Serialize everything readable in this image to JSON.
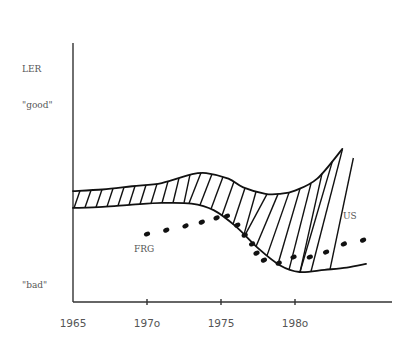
{
  "chart_data": {
    "type": "line",
    "title": "",
    "ylabel": "LER",
    "xlabel": "",
    "y_qualitative_labels": {
      "top": "\"good\"",
      "bottom": "\"bad\""
    },
    "xlim": [
      1965,
      1986.5
    ],
    "ylim": [
      0,
      1
    ],
    "x_ticks": [
      1965,
      1970,
      1975,
      1980
    ],
    "x_tick_labels": [
      "1965",
      "197o",
      "1975",
      "198o"
    ],
    "grid": false,
    "legend": "none",
    "series": [
      {
        "name": "US band upper",
        "style": "solid",
        "points": [
          [
            1965,
            0.433
          ],
          [
            1967,
            0.44
          ],
          [
            1969,
            0.455
          ],
          [
            1971,
            0.47
          ],
          [
            1973,
            0.51
          ],
          [
            1974,
            0.516
          ],
          [
            1975.5,
            0.49
          ],
          [
            1976.5,
            0.45
          ],
          [
            1978,
            0.42
          ],
          [
            1979,
            0.42
          ],
          [
            1980,
            0.435
          ],
          [
            1981.5,
            0.49
          ],
          [
            1983.2,
            0.627
          ]
        ]
      },
      {
        "name": "US band lower",
        "style": "solid",
        "points": [
          [
            1965,
            0.355
          ],
          [
            1967,
            0.36
          ],
          [
            1969,
            0.37
          ],
          [
            1971,
            0.378
          ],
          [
            1973,
            0.375
          ],
          [
            1974.5,
            0.345
          ],
          [
            1976,
            0.27
          ],
          [
            1977.5,
            0.17
          ],
          [
            1979,
            0.09
          ],
          [
            1980.3,
            0.06
          ],
          [
            1982,
            0.07
          ],
          [
            1983.5,
            0.08
          ],
          [
            1984.8,
            0.097
          ]
        ]
      },
      {
        "name": "US",
        "style": "hatched-band-with-diverging-lines",
        "label": "US"
      },
      {
        "name": "FRG",
        "style": "dotted",
        "label": "FRG",
        "points": [
          [
            1970,
            0.235
          ],
          [
            1971.3,
            0.253
          ],
          [
            1972.6,
            0.272
          ],
          [
            1973.7,
            0.29
          ],
          [
            1974.7,
            0.309
          ],
          [
            1975.4,
            0.318
          ],
          [
            1976.1,
            0.276
          ],
          [
            1976.6,
            0.23
          ],
          [
            1977.1,
            0.189
          ],
          [
            1977.4,
            0.147
          ],
          [
            1977.9,
            0.115
          ],
          [
            1978.9,
            0.101
          ],
          [
            1979.9,
            0.129
          ],
          [
            1981,
            0.129
          ],
          [
            1982.1,
            0.152
          ],
          [
            1983.3,
            0.189
          ],
          [
            1984.6,
            0.207
          ]
        ]
      }
    ],
    "annotations": [
      "US",
      "FRG"
    ]
  }
}
